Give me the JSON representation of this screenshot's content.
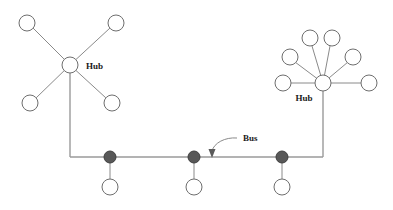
{
  "diagram": {
    "canvas": {
      "width": 393,
      "height": 210,
      "background": "#ffffff"
    },
    "colors": {
      "node_stroke": "#6e6e6e",
      "node_fill": "#ffffff",
      "tap_fill": "#585858",
      "line": "#8a8a8a",
      "trunk": "#9a9a9a",
      "label_text": "#1a1a1a"
    },
    "labels": {
      "hub_left": "Hub",
      "hub_right": "Hub",
      "bus": "Bus"
    },
    "left_star": {
      "hub": {
        "cx": 70,
        "cy": 65,
        "r": 8
      },
      "label_pos": {
        "x": 86,
        "y": 69
      },
      "node_radius": 8,
      "nodes": [
        {
          "id": "left-node-top-left",
          "cx": 27,
          "cy": 23
        },
        {
          "id": "left-node-top-right",
          "cx": 116,
          "cy": 23
        },
        {
          "id": "left-node-bottom-left",
          "cx": 30,
          "cy": 103
        },
        {
          "id": "left-node-bottom-right",
          "cx": 112,
          "cy": 103
        }
      ]
    },
    "right_star": {
      "hub": {
        "cx": 323,
        "cy": 83,
        "r": 8
      },
      "label_pos": {
        "x": 304,
        "y": 100
      },
      "node_radius": 8,
      "nodes": [
        {
          "id": "right-node-left",
          "cx": 283,
          "cy": 83
        },
        {
          "id": "right-node-upper-left",
          "cx": 290,
          "cy": 57
        },
        {
          "id": "right-node-top-left",
          "cx": 310,
          "cy": 38
        },
        {
          "id": "right-node-top-right",
          "cx": 332,
          "cy": 38
        },
        {
          "id": "right-node-upper-right",
          "cx": 353,
          "cy": 57
        },
        {
          "id": "right-node-right",
          "cx": 369,
          "cy": 83
        }
      ]
    },
    "bus": {
      "y": 157,
      "x_start": 70,
      "x_end": 323,
      "label_pos": {
        "x": 243,
        "y": 141
      },
      "arrow_tip": {
        "x": 212,
        "y": 157
      },
      "tap_radius": 6,
      "station_radius": 8,
      "drop_length": 22,
      "taps": [
        {
          "id": "bus-tap-1",
          "cx": 110,
          "station_cy": 186
        },
        {
          "id": "bus-tap-2",
          "cx": 194,
          "station_cy": 186
        },
        {
          "id": "bus-tap-3",
          "cx": 282,
          "station_cy": 186
        }
      ]
    }
  }
}
